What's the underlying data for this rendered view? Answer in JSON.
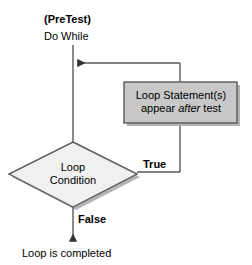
{
  "diagram": {
    "kind": "flowchart",
    "annotations": {
      "pretest": "(PreTest)",
      "entry": "Do While",
      "branch_true": "True",
      "branch_false": "False",
      "terminal": "Loop is completed"
    },
    "nodes": {
      "decision": {
        "shape": "diamond",
        "line1": "Loop",
        "line2": "Condition"
      },
      "process": {
        "shape": "rectangle",
        "line1": "Loop Statement(s)",
        "line2_before": "appear ",
        "line2_emphasis": "after",
        "line2_after": " test"
      }
    },
    "colors": {
      "background": "#ffffff",
      "stroke": "#595959",
      "text": "#000000",
      "decision_fill": "#f0f0f0",
      "process_fill": "#c8c8c8",
      "shadow": "#b4b4b4"
    }
  }
}
